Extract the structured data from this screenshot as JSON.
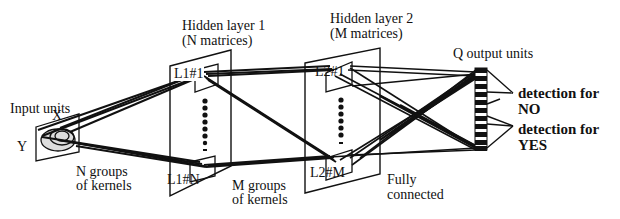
{
  "diagram": {
    "type": "neural-network-architecture",
    "layers": [
      {
        "id": "input",
        "title": "Input units",
        "axes": {
          "x": "X",
          "y": "Y"
        }
      },
      {
        "id": "hidden1",
        "title": "Hidden layer 1",
        "subtitle": "(N matrices)",
        "first_unit": "L1#1",
        "last_unit": "L1#N"
      },
      {
        "id": "hidden2",
        "title": "Hidden layer 2",
        "subtitle": "(M matrices)",
        "first_unit": "L2#1",
        "last_unit": "L2#M"
      },
      {
        "id": "output",
        "title": "Q output units"
      }
    ],
    "connections": [
      {
        "from": "input",
        "to": "hidden1",
        "label_line1": "N groups",
        "label_line2": "of kernels"
      },
      {
        "from": "hidden1",
        "to": "hidden2",
        "label_line1": "M groups",
        "label_line2": "of kernels"
      },
      {
        "from": "hidden2",
        "to": "output",
        "label_line1": "Fully",
        "label_line2": "connected"
      }
    ],
    "outputs": [
      {
        "line1": "detection for",
        "line2": "NO"
      },
      {
        "line1": "detection for",
        "line2": "YES"
      }
    ],
    "colors": {
      "ink": "#111111",
      "background": "#ffffff"
    }
  }
}
